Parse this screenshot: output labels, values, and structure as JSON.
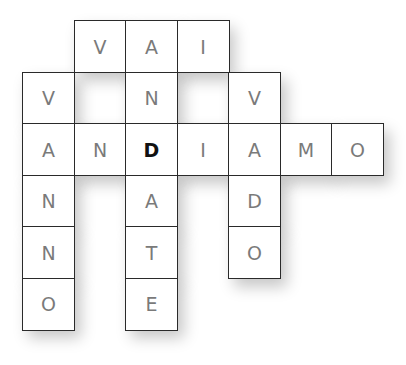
{
  "puzzle": {
    "type": "crossword",
    "cell_size": 51.5,
    "origin": {
      "x": 22,
      "y": 20
    },
    "letter_color": "#7a7a7a",
    "highlight_color": "#111111",
    "cells": [
      {
        "row": 0,
        "col": 1,
        "letter": "V"
      },
      {
        "row": 0,
        "col": 2,
        "letter": "A"
      },
      {
        "row": 0,
        "col": 3,
        "letter": "I"
      },
      {
        "row": 1,
        "col": 0,
        "letter": "V"
      },
      {
        "row": 1,
        "col": 2,
        "letter": "N"
      },
      {
        "row": 1,
        "col": 4,
        "letter": "V"
      },
      {
        "row": 2,
        "col": 0,
        "letter": "A"
      },
      {
        "row": 2,
        "col": 1,
        "letter": "N"
      },
      {
        "row": 2,
        "col": 2,
        "letter": "D",
        "highlight": true
      },
      {
        "row": 2,
        "col": 3,
        "letter": "I"
      },
      {
        "row": 2,
        "col": 4,
        "letter": "A"
      },
      {
        "row": 2,
        "col": 5,
        "letter": "M"
      },
      {
        "row": 2,
        "col": 6,
        "letter": "O"
      },
      {
        "row": 3,
        "col": 0,
        "letter": "N"
      },
      {
        "row": 3,
        "col": 2,
        "letter": "A"
      },
      {
        "row": 3,
        "col": 4,
        "letter": "D"
      },
      {
        "row": 4,
        "col": 0,
        "letter": "N"
      },
      {
        "row": 4,
        "col": 2,
        "letter": "T"
      },
      {
        "row": 4,
        "col": 4,
        "letter": "O"
      },
      {
        "row": 5,
        "col": 0,
        "letter": "O"
      },
      {
        "row": 5,
        "col": 2,
        "letter": "E"
      }
    ],
    "words": [
      {
        "word": "VAI",
        "direction": "across",
        "row": 0,
        "col": 1
      },
      {
        "word": "ANDIAMO",
        "direction": "across",
        "row": 2,
        "col": 0
      },
      {
        "word": "VANNO",
        "direction": "down",
        "row": 1,
        "col": 0
      },
      {
        "word": "ANDATE",
        "direction": "down",
        "row": 0,
        "col": 2
      },
      {
        "word": "VADO",
        "direction": "down",
        "row": 1,
        "col": 4
      }
    ]
  }
}
